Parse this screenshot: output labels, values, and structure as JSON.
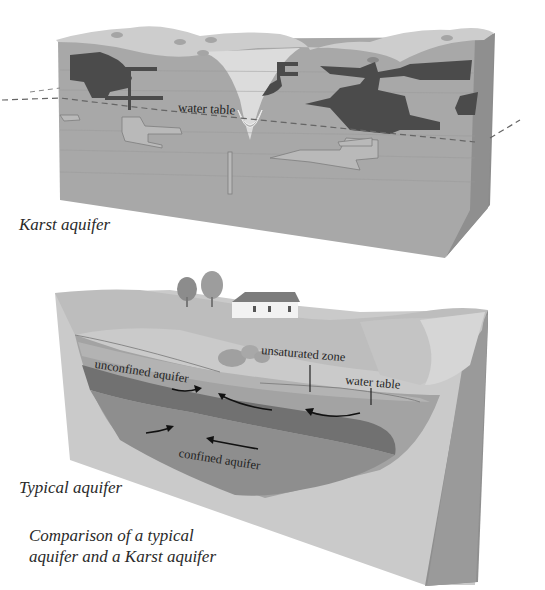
{
  "karst": {
    "caption": "Karst aquifer",
    "labels": {
      "water_table": "water table"
    }
  },
  "typical": {
    "caption": "Typical aquifer",
    "labels": {
      "unconfined_aquifer": "unconfined aquifer",
      "unsaturated_zone": "unsaturated zone",
      "water_table": "water table",
      "confined_aquifer": "confined aquifer"
    }
  },
  "figure_caption": {
    "line1": "Comparison of a typical",
    "line2": "aquifer and a Karst aquifer"
  },
  "colors": {
    "rock_front": "#a9a9a9",
    "rock_top": "#cfcfcf",
    "rock_side": "#8d8d8d",
    "cave_dark": "#4a4a4a",
    "unconfined": "#9a9a9a",
    "confining_layer": "#6e6e6e",
    "confined": "#8a8a8a",
    "block_front": "#c9c9c9"
  }
}
